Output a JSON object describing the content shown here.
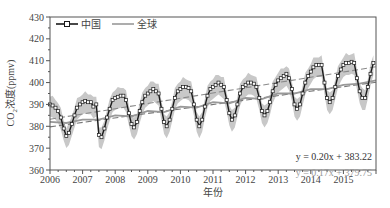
{
  "chart_data": {
    "type": "line",
    "title": "",
    "xlabel": "年份",
    "ylabel": "CO2浓度(ppmv)",
    "ylabel_parts": {
      "pre": "CO",
      "sub": "2",
      "post": "浓度(ppmv)"
    },
    "xlim": [
      2006,
      2016
    ],
    "ylim": [
      360,
      430
    ],
    "xticks": [
      2006,
      2007,
      2008,
      2009,
      2010,
      2011,
      2012,
      2013,
      2014,
      2015
    ],
    "yticks": [
      360,
      370,
      380,
      390,
      400,
      410,
      420,
      430
    ],
    "grid": false,
    "legend": {
      "position": "upper-left",
      "entries": [
        "中国",
        "全球"
      ]
    },
    "colors": {
      "china": "#1a1a1a",
      "global": "#999999",
      "band": "#c8c8c8",
      "axis": "#555555"
    },
    "series": [
      {
        "name": "中国",
        "style": "line-with-square-markers",
        "x": [
          2006.0,
          2006.08,
          2006.17,
          2006.25,
          2006.33,
          2006.42,
          2006.5,
          2006.58,
          2006.67,
          2006.75,
          2006.83,
          2006.92,
          2007.0,
          2007.08,
          2007.17,
          2007.25,
          2007.33,
          2007.42,
          2007.5,
          2007.58,
          2007.67,
          2007.75,
          2007.83,
          2007.92,
          2008.0,
          2008.08,
          2008.17,
          2008.25,
          2008.33,
          2008.42,
          2008.5,
          2008.58,
          2008.67,
          2008.75,
          2008.83,
          2008.92,
          2009.0,
          2009.08,
          2009.17,
          2009.25,
          2009.33,
          2009.42,
          2009.5,
          2009.58,
          2009.67,
          2009.75,
          2009.83,
          2009.92,
          2010.0,
          2010.08,
          2010.17,
          2010.25,
          2010.33,
          2010.42,
          2010.5,
          2010.58,
          2010.67,
          2010.75,
          2010.83,
          2010.92,
          2011.0,
          2011.08,
          2011.17,
          2011.25,
          2011.33,
          2011.42,
          2011.5,
          2011.58,
          2011.67,
          2011.75,
          2011.83,
          2011.92,
          2012.0,
          2012.08,
          2012.17,
          2012.25,
          2012.33,
          2012.42,
          2012.5,
          2012.58,
          2012.67,
          2012.75,
          2012.83,
          2012.92,
          2013.0,
          2013.08,
          2013.17,
          2013.25,
          2013.33,
          2013.42,
          2013.5,
          2013.58,
          2013.67,
          2013.75,
          2013.83,
          2013.92,
          2014.0,
          2014.08,
          2014.17,
          2014.25,
          2014.33,
          2014.42,
          2014.5,
          2014.58,
          2014.67,
          2014.75,
          2014.83,
          2014.92,
          2015.0,
          2015.08,
          2015.17,
          2015.25,
          2015.33,
          2015.42,
          2015.5,
          2015.58,
          2015.67,
          2015.75,
          2015.83,
          2015.92
        ],
        "values": [
          390,
          389.5,
          388.5,
          387,
          384,
          379,
          375.5,
          377,
          381,
          385,
          388.5,
          390,
          391,
          391.5,
          391,
          391,
          389,
          390,
          376,
          375,
          379,
          384,
          388,
          392,
          393,
          393.5,
          394,
          394,
          392,
          386,
          381,
          379.5,
          382,
          387,
          391,
          394,
          395,
          396,
          397,
          396,
          395,
          388,
          382,
          380,
          383,
          388,
          393,
          396,
          397,
          398,
          398,
          397.5,
          396,
          390,
          383,
          380,
          383,
          389,
          394,
          397,
          398,
          399,
          400,
          399,
          398,
          392,
          386,
          383,
          385,
          390,
          395,
          398,
          399,
          400,
          400,
          399.5,
          398,
          393,
          387,
          385,
          387,
          391,
          396,
          399,
          401,
          402,
          403,
          404,
          402,
          397,
          390,
          388,
          390,
          395,
          400,
          403,
          405,
          407,
          408,
          408,
          408,
          400,
          393,
          391,
          393,
          398,
          403,
          406,
          408,
          409,
          409,
          409.5,
          409,
          402,
          396,
          393,
          393,
          398,
          404,
          409
        ]
      },
      {
        "name": "全球",
        "style": "line",
        "x": [
          2006,
          2006.5,
          2007,
          2007.5,
          2008,
          2008.5,
          2009,
          2009.5,
          2010,
          2010.5,
          2011,
          2011.5,
          2012,
          2012.5,
          2013,
          2013.5,
          2014,
          2014.5,
          2015,
          2015.5,
          2016
        ],
        "values": [
          382,
          381.5,
          383,
          383,
          385,
          384.5,
          387,
          386.5,
          389,
          388.5,
          391,
          390.5,
          393,
          392.5,
          395,
          395,
          397,
          397,
          399,
          399.5,
          401
        ]
      },
      {
        "name": "中国 趋势线",
        "style": "dashed",
        "equation": "y = 0.20x + 383.22",
        "x": [
          2006,
          2016
        ],
        "values": [
          383.22,
          407.22
        ]
      },
      {
        "name": "全球 趋势线",
        "style": "dashed",
        "equation": "y = 0.17x + 379.75",
        "x": [
          2006,
          2016
        ],
        "values": [
          379.75,
          400.15
        ]
      }
    ],
    "band": {
      "name": "中国 范围",
      "upper_offset": 3.5,
      "lower_offset": 5.5
    },
    "annotations": [
      {
        "text": "y = 0.20x + 383.22",
        "color": "#333333"
      },
      {
        "text": "y = 0.17x + 379.75",
        "color": "#9a9a9a"
      }
    ]
  },
  "labels": {
    "legend_china": "中国",
    "legend_global": "全球",
    "eq_china": "y = 0.20x + 383.22",
    "eq_global": "y = 0.17x + 379.75",
    "xlabel": "年份",
    "ylabel_pre": "CO",
    "ylabel_sub": "2",
    "ylabel_post": "浓度(ppmv)"
  }
}
